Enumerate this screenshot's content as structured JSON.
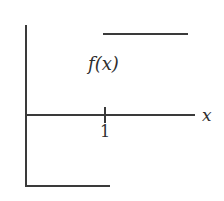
{
  "figure": {
    "kind": "step-function-graph",
    "background_color": "#ffffff",
    "stroke_color": "#3a3a3a",
    "text_color": "#2e2e2e"
  },
  "labels": {
    "function_label": "f(x)",
    "x_axis_label": "x",
    "tick_label_one": "1"
  },
  "chart_data": {
    "type": "line",
    "title": "",
    "xlabel": "x",
    "ylabel": "",
    "grid": false,
    "legend": "none",
    "annotations": [
      {
        "text": "f(x)",
        "x": 1.0,
        "y": 1.3
      }
    ],
    "xticks": [
      1
    ],
    "xticklabels": [
      "1"
    ],
    "yticks": [],
    "yticklabels": [],
    "xlim": [
      0,
      2.4
    ],
    "ylim": [
      -1.3,
      2.3
    ],
    "series": [
      {
        "name": "f(x) lower branch",
        "values": [
          {
            "x": 0.0,
            "y": -1.0
          },
          {
            "x": 1.2,
            "y": -1.0
          }
        ]
      },
      {
        "name": "f(x) upper branch",
        "values": [
          {
            "x": 1.1,
            "y": 1.9
          },
          {
            "x": 2.3,
            "y": 1.9
          }
        ]
      }
    ]
  }
}
